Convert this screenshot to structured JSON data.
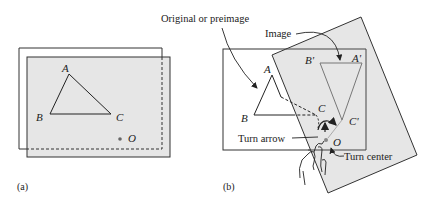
{
  "figure": {
    "colors": {
      "paper_fill": "#e6e6e6",
      "line": "#333333",
      "image_triangle": "#777777",
      "background": "#ffffff"
    },
    "panel_a": {
      "caption": "(a)",
      "vertex_labels": {
        "A": "A",
        "B": "B",
        "C": "C"
      },
      "center_label": "O"
    },
    "panel_b": {
      "caption": "(b)",
      "vertex_labels": {
        "A": "A",
        "B": "B",
        "C": "C"
      },
      "image_vertex_labels": {
        "A": "A'",
        "B": "B'",
        "C": "C'"
      },
      "center_label": "O",
      "annotations": {
        "original": "Original or preimage",
        "image": "Image",
        "turn_arrow": "Turn arrow",
        "turn_center": "Turn center"
      }
    }
  }
}
